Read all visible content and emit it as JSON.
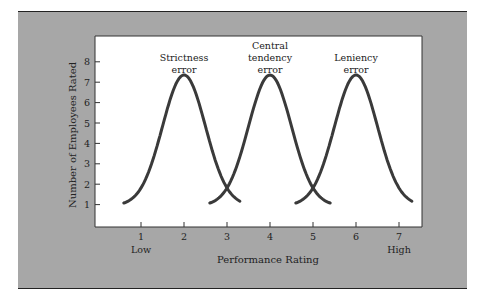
{
  "chart_data": {
    "type": "line",
    "title": "",
    "xlabel": "Performance Rating",
    "ylabel": "Number of Employees Rated",
    "x_ticks": [
      1,
      2,
      3,
      4,
      5,
      6,
      7
    ],
    "y_ticks": [
      1,
      2,
      3,
      4,
      5,
      6,
      7,
      8
    ],
    "x_tick_sublabels": {
      "1": "Low",
      "7": "High"
    },
    "xlim": [
      0,
      7.6
    ],
    "ylim": [
      0,
      9
    ],
    "grid": false,
    "legend": "none",
    "series": [
      {
        "name": "Strictness error",
        "label_lines": [
          "Strictness",
          "error"
        ],
        "center": 2,
        "peak": 7.3,
        "x_range": [
          0.6,
          3.3
        ],
        "base": 1.0
      },
      {
        "name": "Central tendency error",
        "label_lines": [
          "Central",
          "tendency",
          "error"
        ],
        "center": 4,
        "peak": 7.3,
        "x_range": [
          2.6,
          5.4
        ],
        "base": 1.0
      },
      {
        "name": "Leniency error",
        "label_lines": [
          "Leniency",
          "error"
        ],
        "center": 6,
        "peak": 7.3,
        "x_range": [
          4.6,
          7.3
        ],
        "base": 1.0
      }
    ]
  },
  "colors": {
    "panel": "#a7a7a7",
    "plot_bg": "#ffffff",
    "curve": "#3a3a3a",
    "text": "#222222"
  }
}
